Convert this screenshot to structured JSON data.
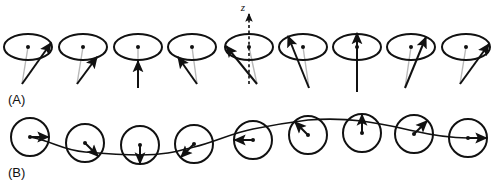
{
  "figure": {
    "background_color": "#ffffff",
    "stroke_color": "#111111",
    "width": 493,
    "height": 185
  },
  "panels": [
    {
      "id": "A",
      "label": "(A)",
      "label_x": 8,
      "label_y": 104,
      "description": "perspective view: precession cones with spin vectors",
      "view": "perspective",
      "ellipse_rx": 24,
      "ellipse_ry": 13,
      "cone_cy": 47,
      "axis": {
        "name": "z",
        "label": "z",
        "label_x": 243,
        "label_y": 11,
        "style": "dashed",
        "on_cone_index": 4,
        "x": 249,
        "y_top": 14,
        "y_bottom": 84
      },
      "cones": [
        {
          "index": 0,
          "cx": 28,
          "phase_deg": 0,
          "tip_dx": 23,
          "tip_dy": -4,
          "apex_dx": -6,
          "apex_dy": 37,
          "arrow": "right"
        },
        {
          "index": 1,
          "cx": 83,
          "phase_deg": 45,
          "tip_dx": 14,
          "tip_dy": 10,
          "apex_dx": -6,
          "apex_dy": 37,
          "arrow": "up-right-front"
        },
        {
          "index": 2,
          "cx": 138,
          "phase_deg": 90,
          "tip_dx": 0,
          "tip_dy": 14,
          "apex_dx": 0,
          "apex_dy": 41,
          "arrow": "up-front"
        },
        {
          "index": 3,
          "cx": 192,
          "phase_deg": 135,
          "tip_dx": -14,
          "tip_dy": 10,
          "apex_dx": 5,
          "apex_dy": 37,
          "arrow": "up-left-front"
        },
        {
          "index": 4,
          "cx": 249,
          "phase_deg": 180,
          "tip_dx": -23,
          "tip_dy": -1,
          "apex_dx": 8,
          "apex_dy": 37,
          "arrow": "left"
        },
        {
          "index": 5,
          "cx": 303,
          "phase_deg": 225,
          "tip_dx": -15,
          "tip_dy": -11,
          "apex_dx": 6,
          "apex_dy": 41,
          "arrow": "up-left-back"
        },
        {
          "index": 6,
          "cx": 357,
          "phase_deg": 270,
          "tip_dx": 0,
          "tip_dy": -14,
          "apex_dx": 0,
          "apex_dy": 45,
          "arrow": "up-back"
        },
        {
          "index": 7,
          "cx": 411,
          "phase_deg": 315,
          "tip_dx": 15,
          "tip_dy": -10,
          "apex_dx": -6,
          "apex_dy": 41,
          "arrow": "up-right-back"
        },
        {
          "index": 8,
          "cx": 466,
          "phase_deg": 360,
          "tip_dx": 23,
          "tip_dy": -3,
          "apex_dx": -6,
          "apex_dy": 37,
          "arrow": "right"
        }
      ]
    },
    {
      "id": "B",
      "label": "(B)",
      "label_x": 8,
      "label_y": 177,
      "description": "top view: circles with radial spin arrows and connecting wave curve",
      "view": "top",
      "circle_r": 19,
      "circles": [
        {
          "index": 0,
          "cx": 30,
          "cy": 137,
          "angle_deg": 0,
          "arrow": "right"
        },
        {
          "index": 1,
          "cx": 85,
          "cy": 143,
          "angle_deg": 45,
          "arrow": "down-right"
        },
        {
          "index": 2,
          "cx": 140,
          "cy": 145,
          "angle_deg": 90,
          "arrow": "down"
        },
        {
          "index": 3,
          "cx": 194,
          "cy": 144,
          "angle_deg": 135,
          "arrow": "down-left"
        },
        {
          "index": 4,
          "cx": 253,
          "cy": 140,
          "angle_deg": 180,
          "arrow": "left"
        },
        {
          "index": 5,
          "cx": 308,
          "cy": 135,
          "angle_deg": 225,
          "arrow": "up-left"
        },
        {
          "index": 6,
          "cx": 362,
          "cy": 133,
          "angle_deg": 270,
          "arrow": "up"
        },
        {
          "index": 7,
          "cx": 414,
          "cy": 134,
          "angle_deg": 315,
          "arrow": "up-right"
        },
        {
          "index": 8,
          "cx": 468,
          "cy": 138,
          "angle_deg": 360,
          "arrow": "right"
        }
      ],
      "wave_path": "M 30,137 C 55,142 62,150 85,152 C 108,154 120,155 140,155 C 165,155 178,151 194,147 C 215,142 232,133 253,129 C 278,124 292,122 308,120 C 332,118 345,119 362,121 C 385,124 400,128 414,131 C 436,136 452,138 468,138"
    }
  ]
}
